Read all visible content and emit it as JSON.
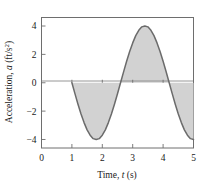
{
  "chart_data": {
    "type": "area",
    "title": "",
    "xlabel": "Time, t (s)",
    "xlabel_prefix": "Time, ",
    "xlabel_symbol": "t",
    "xlabel_unit": " (s)",
    "ylabel": "Acceleration, a (ft/s²)",
    "ylabel_prefix": "Acceleration, ",
    "ylabel_symbol": "a",
    "ylabel_unit": " (ft/s",
    "ylabel_exponent": "2",
    "ylabel_unit_close": ")",
    "xlim": [
      0,
      5
    ],
    "ylim": [
      -4.6,
      4.6
    ],
    "xticks": [
      0,
      1,
      2,
      3,
      4,
      5
    ],
    "xtick_labels": [
      "0",
      "1",
      "2",
      "3",
      "4",
      "5"
    ],
    "yticks": [
      4,
      2,
      0,
      -2,
      -4
    ],
    "ytick_labels": [
      "4",
      "2",
      "0",
      "−2",
      "−4"
    ],
    "grid": false,
    "legend": null,
    "curve_equation": "a = -4 sin(2π(t-1)/3.2)",
    "amplitude": 4,
    "period": 3.2,
    "t_start": 1,
    "t_end": 5,
    "zero_crossings": [
      1,
      2.6,
      4.2
    ],
    "minimum_point": [
      1.8,
      -4
    ],
    "maximum_point": [
      3.4,
      4
    ],
    "fill_color": "#d2d2d2",
    "line_color": "#6b6b6b",
    "axis_color": "#6e6e6e",
    "series": [
      {
        "name": "acceleration",
        "x": [
          1.0,
          1.1,
          1.2,
          1.3,
          1.4,
          1.5,
          1.6,
          1.7,
          1.8,
          1.9,
          2.0,
          2.1,
          2.2,
          2.3,
          2.4,
          2.5,
          2.6,
          2.7,
          2.8,
          2.9,
          3.0,
          3.1,
          3.2,
          3.3,
          3.4,
          3.5,
          3.6,
          3.7,
          3.8,
          3.9,
          4.0,
          4.1,
          4.2,
          4.3,
          4.4,
          4.5,
          4.6,
          4.7,
          4.8,
          4.9,
          5.0
        ],
        "values": [
          0.0,
          -0.77,
          -1.51,
          -2.2,
          -2.81,
          -3.32,
          -3.7,
          -3.94,
          -4.0,
          -3.94,
          -3.7,
          -3.32,
          -2.81,
          -2.2,
          -1.51,
          -0.77,
          0.0,
          0.77,
          1.51,
          2.2,
          2.81,
          3.32,
          3.7,
          3.94,
          4.0,
          3.94,
          3.7,
          3.32,
          2.81,
          2.2,
          1.51,
          0.77,
          0.0,
          -0.77,
          -1.51,
          -2.2,
          -2.81,
          -3.32,
          -3.7,
          -3.94,
          -4.0
        ]
      }
    ]
  },
  "figure": {
    "name": "acceleration-vs-time-plot"
  }
}
